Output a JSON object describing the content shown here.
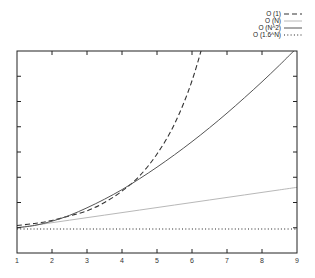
{
  "chart_data": {
    "type": "line",
    "title": "",
    "xlabel": "",
    "ylabel": "",
    "xlim": [
      1,
      9
    ],
    "ylim": [
      0,
      8
    ],
    "x_ticks": [
      "1",
      "2",
      "3",
      "4",
      "5",
      "6",
      "7",
      "8",
      "9"
    ],
    "y_ticks_count": 9,
    "y_tick_labels_visible": false,
    "grid": false,
    "legend_position": "top-right, outside plot",
    "x": [
      1,
      1.5,
      2,
      2.5,
      3,
      3.5,
      4,
      4.5,
      5,
      5.5,
      6,
      6.5,
      7,
      7.5,
      8,
      8.5,
      9
    ],
    "series": [
      {
        "name": "O (1)",
        "style": "dashed",
        "color": "#333333",
        "values": [
          1.09,
          1.17,
          1.29,
          1.47,
          1.67,
          2.0,
          2.45,
          3.05,
          3.92,
          5.11,
          6.82,
          9.2,
          null,
          null,
          null,
          null,
          null
        ]
      },
      {
        "name": "O (N)",
        "style": "solid-light",
        "color": "#b8b8b8",
        "values": [
          1.0,
          1.1,
          1.2,
          1.3,
          1.4,
          1.5,
          1.6,
          1.7,
          1.8,
          1.9,
          2.0,
          2.1,
          2.2,
          2.3,
          2.4,
          2.5,
          2.6
        ]
      },
      {
        "name": "O (N^2)",
        "style": "solid",
        "color": "#555555",
        "values": [
          1.0,
          1.09,
          1.26,
          1.49,
          1.79,
          2.13,
          2.51,
          2.94,
          3.4,
          3.89,
          4.41,
          4.96,
          5.54,
          6.15,
          6.78,
          7.44,
          8.13
        ]
      },
      {
        "name": "O (1.6^N)",
        "style": "dotted",
        "color": "#222222",
        "values": [
          0.95,
          0.95,
          0.95,
          0.95,
          0.95,
          0.95,
          0.95,
          0.95,
          0.95,
          0.95,
          0.95,
          0.95,
          0.95,
          0.95,
          0.95,
          0.95,
          0.95
        ]
      }
    ]
  },
  "legend": {
    "items": [
      {
        "label": "O (1)",
        "style": "dashed"
      },
      {
        "label": "O (N)",
        "style": "light"
      },
      {
        "label": "O (N^2)",
        "style": "solid"
      },
      {
        "label": "O (1.6^N)",
        "style": "dotted"
      }
    ]
  }
}
